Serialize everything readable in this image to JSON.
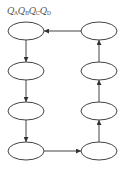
{
  "header": {
    "label_parts": [
      {
        "base": "Q",
        "sub": "A"
      },
      {
        "base": "Q",
        "sub": "B"
      },
      {
        "base": "Q",
        "sub": "C"
      },
      {
        "base": "Q",
        "sub": "D"
      }
    ]
  },
  "diagram": {
    "type": "state-cycle",
    "stroke_color": "#444444",
    "states": [
      {
        "id": "s1",
        "cx": 26,
        "cy": 31,
        "label": ""
      },
      {
        "id": "s2",
        "cx": 26,
        "cy": 71,
        "label": ""
      },
      {
        "id": "s3",
        "cx": 26,
        "cy": 111,
        "label": ""
      },
      {
        "id": "s4",
        "cx": 26,
        "cy": 151,
        "label": ""
      },
      {
        "id": "s5",
        "cx": 99,
        "cy": 151,
        "label": ""
      },
      {
        "id": "s6",
        "cx": 99,
        "cy": 111,
        "label": ""
      },
      {
        "id": "s7",
        "cx": 99,
        "cy": 71,
        "label": ""
      },
      {
        "id": "s8",
        "cx": 99,
        "cy": 31,
        "label": ""
      }
    ],
    "transitions": [
      {
        "from": "s1",
        "to": "s2"
      },
      {
        "from": "s2",
        "to": "s3"
      },
      {
        "from": "s3",
        "to": "s4"
      },
      {
        "from": "s4",
        "to": "s5"
      },
      {
        "from": "s5",
        "to": "s6"
      },
      {
        "from": "s6",
        "to": "s7"
      },
      {
        "from": "s7",
        "to": "s8"
      },
      {
        "from": "s8",
        "to": "s1"
      }
    ]
  }
}
